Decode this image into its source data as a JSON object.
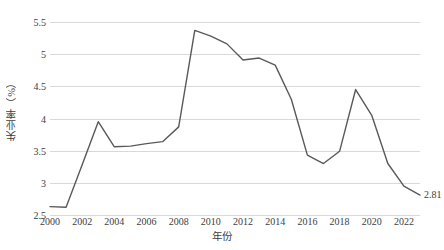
{
  "chart_data": {
    "type": "line",
    "title": "",
    "subtitle": "",
    "xlabel": "年份",
    "ylabel": "失业率（%）",
    "x": [
      2000,
      2001,
      2002,
      2003,
      2004,
      2005,
      2006,
      2007,
      2008,
      2009,
      2010,
      2011,
      2012,
      2013,
      2014,
      2015,
      2016,
      2017,
      2018,
      2019,
      2020,
      2021,
      2022,
      2023
    ],
    "series": [
      {
        "name": "失业率",
        "color": "#595959",
        "values": [
          2.63,
          2.62,
          3.28,
          3.95,
          3.56,
          3.57,
          3.61,
          3.64,
          3.87,
          5.37,
          5.28,
          5.16,
          4.91,
          4.94,
          4.83,
          4.3,
          3.43,
          3.3,
          3.49,
          4.45,
          4.05,
          3.3,
          2.95,
          2.81
        ]
      }
    ],
    "xlim": [
      2000,
      2023
    ],
    "ylim": [
      2.5,
      5.5
    ],
    "yticks": [
      2.5,
      3,
      3.5,
      4,
      4.5,
      5,
      5.5
    ],
    "ytick_labels": [
      "2.5",
      "3",
      "3.5",
      "4",
      "4.5",
      "5",
      "5.5"
    ],
    "xticks": [
      2000,
      2002,
      2004,
      2006,
      2008,
      2010,
      2012,
      2014,
      2016,
      2018,
      2020,
      2022
    ],
    "xtick_labels": [
      "2000",
      "2002",
      "2004",
      "2006",
      "2008",
      "2010",
      "2012",
      "2014",
      "2016",
      "2018",
      "2020",
      "2022"
    ],
    "grid": "horizontal",
    "legend": "none",
    "annotations": [
      {
        "text": "2.81",
        "x": 2023,
        "y": 2.81,
        "position": "right"
      }
    ],
    "background_color": "#ffffff",
    "gridline_color": "#d9d9d9",
    "text_color": "#404040"
  }
}
